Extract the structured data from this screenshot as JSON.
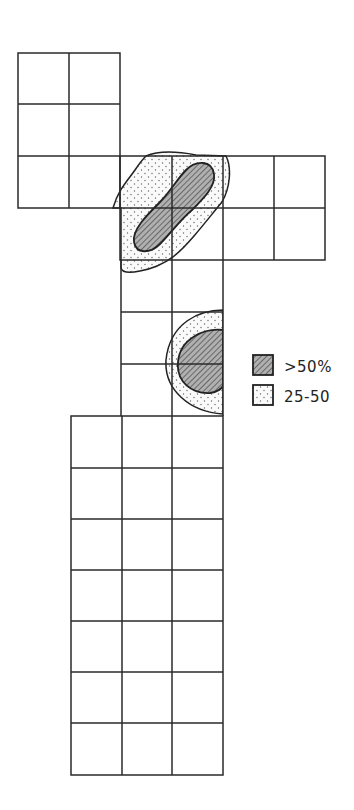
{
  "diagram": {
    "cell_size": 51,
    "grid_blocks": [
      {
        "name": "upper-left-block",
        "x": 18,
        "y": 53,
        "cols": 2,
        "rows": 3
      },
      {
        "name": "upper-right-arm",
        "x": 120,
        "y": 156,
        "cols": 4,
        "rows": 2
      },
      {
        "name": "middle-column",
        "x": 120,
        "y": 260,
        "cols": 2,
        "rows": 3
      },
      {
        "name": "bottom-block",
        "x": 71,
        "y": 416,
        "cols": 3,
        "rows": 7
      }
    ],
    "regions": [
      {
        "name": "upper-region",
        "levels": [
          ">50%",
          "25-50"
        ]
      },
      {
        "name": "lower-region",
        "levels": [
          ">50%",
          "25-50"
        ]
      }
    ]
  },
  "legend": {
    "items": [
      {
        "pattern": "hatched",
        "label": ">50%"
      },
      {
        "pattern": "dotted",
        "label": "25-50"
      }
    ]
  },
  "colors": {
    "line": "#2a2a2a",
    "hatch_fill": "#9a9a9a",
    "dot": "#555555",
    "background": "#ffffff"
  }
}
